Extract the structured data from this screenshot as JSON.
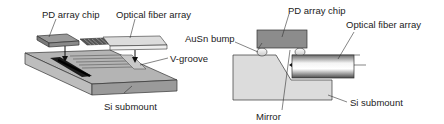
{
  "figure": {
    "left_panel": {
      "labels": {
        "pd_chip": "PD array chip",
        "fiber_array": "Optical fiber array",
        "v_groove": "V-groove",
        "si_submount": "Si submount"
      }
    },
    "right_panel": {
      "labels": {
        "pd_chip": "PD array chip",
        "fiber_array": "Optical fiber array",
        "ausn_bump": "AuSn bump",
        "mirror": "Mirror",
        "si_submount": "Si submount"
      }
    },
    "colors": {
      "submount_top": "#b4b4b4",
      "submount_front": "#9a9a9a",
      "submount_side": "#bdbdbd",
      "chip": "#8c8c8c",
      "fiber_array": "#d6d6d6",
      "cross_section_si": "#dcdcdc",
      "outline": "#333333"
    }
  }
}
